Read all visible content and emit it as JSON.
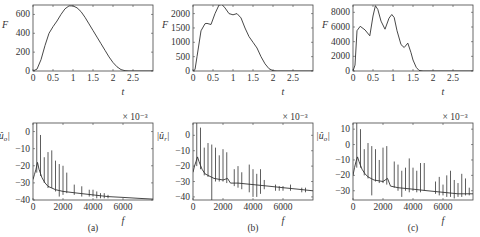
{
  "chart_data": [
    {
      "panel": "(a)",
      "row": "top",
      "type": "line",
      "xlabel": "t",
      "ylabel": "F",
      "xlim": [
        0,
        3
      ],
      "ylim": [
        0,
        700
      ],
      "xticks": [
        0,
        0.5,
        1,
        1.5,
        2,
        2.5
      ],
      "xtick_labels": [
        "0",
        "0.5",
        "1",
        "1.5",
        "2",
        "2.5"
      ],
      "yticks": [
        0,
        200,
        400,
        600
      ],
      "ytick_labels": [
        "0",
        "200",
        "400",
        "600"
      ],
      "frame": {
        "x": 33,
        "y": 5,
        "w": 120,
        "h": 66
      },
      "x": [
        0,
        0.1,
        0.2,
        0.3,
        0.4,
        0.5,
        0.6,
        0.7,
        0.8,
        0.9,
        1.0,
        1.1,
        1.2,
        1.3,
        1.4,
        1.5,
        1.6,
        1.7,
        1.8,
        1.9,
        2.0,
        2.1,
        2.2,
        2.3,
        2.4,
        2.6,
        3.0
      ],
      "values": [
        0,
        20,
        120,
        270,
        400,
        470,
        530,
        600,
        660,
        690,
        690,
        670,
        630,
        570,
        500,
        430,
        360,
        290,
        220,
        150,
        90,
        45,
        15,
        3,
        0,
        0,
        0
      ]
    },
    {
      "panel": "(b)",
      "row": "top",
      "type": "line",
      "xlabel": "t",
      "ylabel": "F",
      "xlim": [
        0,
        3
      ],
      "ylim": [
        0,
        2300
      ],
      "xticks": [
        0,
        0.5,
        1,
        1.5,
        2,
        2.5
      ],
      "xtick_labels": [
        "0",
        "0.5",
        "1",
        "1.5",
        "2",
        "2.5"
      ],
      "yticks": [
        0,
        500,
        1000,
        1500,
        2000
      ],
      "ytick_labels": [
        "0",
        "500",
        "1000",
        "1500",
        "2000"
      ],
      "frame": {
        "x": 193,
        "y": 5,
        "w": 120,
        "h": 66
      },
      "x": [
        0,
        0.05,
        0.1,
        0.2,
        0.3,
        0.35,
        0.45,
        0.55,
        0.65,
        0.72,
        0.8,
        0.9,
        1.0,
        1.1,
        1.2,
        1.3,
        1.4,
        1.5,
        1.6,
        1.7,
        1.8,
        1.9,
        2.0,
        2.1,
        3.0
      ],
      "values": [
        0,
        50,
        500,
        1400,
        1650,
        1660,
        1620,
        2000,
        2300,
        2320,
        2200,
        2000,
        1960,
        2000,
        1850,
        1500,
        1200,
        1000,
        800,
        500,
        250,
        80,
        10,
        0,
        0
      ]
    },
    {
      "panel": "(c)",
      "row": "top",
      "type": "line",
      "xlabel": "t",
      "ylabel": "F",
      "xlim": [
        0,
        3
      ],
      "ylim": [
        0,
        9000
      ],
      "xticks": [
        0,
        0.5,
        1,
        1.5,
        2,
        2.5
      ],
      "xtick_labels": [
        "0",
        "0.5",
        "1",
        "1.5",
        "2",
        "2.5"
      ],
      "yticks": [
        0,
        2000,
        4000,
        6000,
        8000
      ],
      "ytick_labels": [
        "0",
        "2000",
        "4000",
        "6000",
        "8000"
      ],
      "frame": {
        "x": 353,
        "y": 5,
        "w": 120,
        "h": 66
      },
      "x": [
        0,
        0.05,
        0.1,
        0.18,
        0.3,
        0.42,
        0.5,
        0.56,
        0.62,
        0.7,
        0.8,
        0.9,
        0.97,
        1.03,
        1.1,
        1.2,
        1.28,
        1.37,
        1.45,
        1.5,
        1.58,
        1.65,
        1.75,
        3.0
      ],
      "values": [
        0,
        800,
        5500,
        6100,
        5600,
        4800,
        7500,
        8900,
        8400,
        6800,
        5700,
        7200,
        7700,
        7300,
        5500,
        3600,
        3200,
        3800,
        2500,
        1500,
        500,
        80,
        0,
        0
      ]
    },
    {
      "panel": "(a)",
      "row": "bottom",
      "type": "line",
      "xlabel": "f",
      "ylabel": "|û_o|",
      "yscale_label": "× 10⁻³",
      "xlim": [
        0,
        8000
      ],
      "ylim": [
        -40,
        5
      ],
      "xticks": [
        0,
        2000,
        4000,
        6000
      ],
      "xtick_labels": [
        "0",
        "2000",
        "4000",
        "6000"
      ],
      "yticks": [
        0,
        -10,
        -20,
        -30,
        -40
      ],
      "ytick_labels": [
        "0",
        "−10",
        "−20",
        "−30",
        "−40"
      ],
      "frame": {
        "x": 33,
        "y": 123,
        "w": 120,
        "h": 77
      },
      "baseline": {
        "x": [
          0,
          100,
          200,
          300,
          400,
          600,
          800,
          1000,
          1500,
          2000,
          3000,
          4000,
          5000,
          6000,
          7000,
          8000
        ],
        "y": [
          -28,
          -25,
          -22,
          -18,
          -22,
          -27,
          -30,
          -32,
          -34,
          -35,
          -36,
          -37,
          -38,
          -38.5,
          -39,
          -39.5
        ]
      },
      "peaks": [
        {
          "f": 250,
          "top": 5,
          "bottom": -24
        },
        {
          "f": 500,
          "top": -2,
          "bottom": -26
        },
        {
          "f": 750,
          "top": -15,
          "bottom": -30
        },
        {
          "f": 1000,
          "top": -12,
          "bottom": -33
        },
        {
          "f": 1250,
          "top": -11,
          "bottom": -33
        },
        {
          "f": 1500,
          "top": -17,
          "bottom": -35
        },
        {
          "f": 1750,
          "top": -19,
          "bottom": -38
        },
        {
          "f": 2000,
          "top": -20,
          "bottom": -37
        },
        {
          "f": 2250,
          "top": -24,
          "bottom": -36
        },
        {
          "f": 2750,
          "top": -31,
          "bottom": -37
        },
        {
          "f": 3250,
          "top": -32,
          "bottom": -38
        },
        {
          "f": 3750,
          "top": -34,
          "bottom": -38
        },
        {
          "f": 4000,
          "top": -34,
          "bottom": -38
        },
        {
          "f": 4250,
          "top": -35,
          "bottom": -39
        },
        {
          "f": 4500,
          "top": -36,
          "bottom": -39
        },
        {
          "f": 4750,
          "top": -36,
          "bottom": -39
        },
        {
          "f": 5000,
          "top": -37,
          "bottom": -39
        }
      ]
    },
    {
      "panel": "(b)",
      "row": "bottom",
      "type": "line",
      "xlabel": "f",
      "ylabel": "|û_r|",
      "yscale_label": "× 10⁻³",
      "xlim": [
        0,
        8000
      ],
      "ylim": [
        -42,
        8
      ],
      "xticks": [
        0,
        2000,
        4000,
        6000
      ],
      "xtick_labels": [
        "0",
        "2000",
        "4000",
        "6000"
      ],
      "yticks": [
        0,
        -10,
        -20,
        -30,
        -40
      ],
      "ytick_labels": [
        "0",
        "−10",
        "−20",
        "−30",
        "−40"
      ],
      "frame": {
        "x": 193,
        "y": 123,
        "w": 120,
        "h": 77
      },
      "baseline": {
        "x": [
          0,
          100,
          200,
          300,
          400,
          600,
          800,
          1000,
          1400,
          2000,
          2300,
          2500,
          3000,
          4000,
          5000,
          6000,
          7000,
          8000
        ],
        "y": [
          -24,
          -20,
          -17,
          -14,
          -17,
          -22,
          -25,
          -26,
          -28,
          -29,
          -28,
          -31,
          -31,
          -32,
          -33,
          -34,
          -35,
          -36
        ]
      },
      "peaks": [
        {
          "f": 250,
          "top": 8,
          "bottom": -20
        },
        {
          "f": 500,
          "top": 5,
          "bottom": -22
        },
        {
          "f": 750,
          "top": -8,
          "bottom": -26
        },
        {
          "f": 1000,
          "top": -5,
          "bottom": -27
        },
        {
          "f": 1250,
          "top": -6,
          "bottom": -42
        },
        {
          "f": 1500,
          "top": -8,
          "bottom": -30
        },
        {
          "f": 1750,
          "top": -13,
          "bottom": -30
        },
        {
          "f": 2000,
          "top": -9,
          "bottom": -30
        },
        {
          "f": 2250,
          "top": -11,
          "bottom": -31
        },
        {
          "f": 2750,
          "top": -22,
          "bottom": -33
        },
        {
          "f": 3000,
          "top": -20,
          "bottom": -34
        },
        {
          "f": 3250,
          "top": -24,
          "bottom": -35
        },
        {
          "f": 3750,
          "top": -19,
          "bottom": -37
        },
        {
          "f": 4000,
          "top": -22,
          "bottom": -40
        },
        {
          "f": 4250,
          "top": -25,
          "bottom": -40
        },
        {
          "f": 4500,
          "top": -22,
          "bottom": -38
        },
        {
          "f": 4750,
          "top": -29,
          "bottom": -35
        },
        {
          "f": 5500,
          "top": -32,
          "bottom": -36
        },
        {
          "f": 5750,
          "top": -33,
          "bottom": -36
        },
        {
          "f": 6000,
          "top": -33,
          "bottom": -36
        },
        {
          "f": 6500,
          "top": -32,
          "bottom": -36
        },
        {
          "f": 7250,
          "top": -34,
          "bottom": -37
        },
        {
          "f": 7500,
          "top": -34,
          "bottom": -37
        }
      ]
    },
    {
      "panel": "(c)",
      "row": "bottom",
      "type": "line",
      "xlabel": "f",
      "ylabel": "|û_o|",
      "yscale_label": "× 10⁻³",
      "xlim": [
        0,
        8000
      ],
      "ylim": [
        -36,
        14
      ],
      "xticks": [
        0,
        2000,
        4000,
        6000
      ],
      "xtick_labels": [
        "0",
        "2000",
        "4000",
        "6000"
      ],
      "yticks": [
        10,
        0,
        -10,
        -20,
        -30
      ],
      "ytick_labels": [
        "10",
        "0",
        "−10",
        "−20",
        "−30"
      ],
      "frame": {
        "x": 353,
        "y": 123,
        "w": 120,
        "h": 77
      },
      "baseline": {
        "x": [
          0,
          100,
          200,
          300,
          400,
          600,
          800,
          1000,
          1400,
          2000,
          2300,
          2500,
          3000,
          4000,
          5000,
          6000,
          7000,
          8000
        ],
        "y": [
          -20,
          -15,
          -11,
          -8,
          -11,
          -16,
          -19,
          -21,
          -23,
          -24,
          -22,
          -27,
          -28,
          -29,
          -30,
          -31,
          -32,
          -32
        ]
      },
      "peaks": [
        {
          "f": 250,
          "top": 14,
          "bottom": -15
        },
        {
          "f": 500,
          "top": 10,
          "bottom": -15
        },
        {
          "f": 750,
          "top": -3,
          "bottom": -20
        },
        {
          "f": 1000,
          "top": 1,
          "bottom": -22
        },
        {
          "f": 1250,
          "top": -1,
          "bottom": -33
        },
        {
          "f": 1500,
          "top": -3,
          "bottom": -24
        },
        {
          "f": 1750,
          "top": -10,
          "bottom": -25
        },
        {
          "f": 2000,
          "top": -2,
          "bottom": -25
        },
        {
          "f": 2250,
          "top": -1,
          "bottom": -26
        },
        {
          "f": 2750,
          "top": -11,
          "bottom": -28
        },
        {
          "f": 3000,
          "top": -13,
          "bottom": -30
        },
        {
          "f": 3250,
          "top": -17,
          "bottom": -34
        },
        {
          "f": 3500,
          "top": -15,
          "bottom": -30
        },
        {
          "f": 3750,
          "top": -9,
          "bottom": -31
        },
        {
          "f": 4000,
          "top": -15,
          "bottom": -30
        },
        {
          "f": 4250,
          "top": -17,
          "bottom": -31
        },
        {
          "f": 4500,
          "top": -12,
          "bottom": -31
        },
        {
          "f": 4750,
          "top": -12,
          "bottom": -30
        },
        {
          "f": 5500,
          "top": -24,
          "bottom": -32
        },
        {
          "f": 5750,
          "top": -21,
          "bottom": -33
        },
        {
          "f": 6000,
          "top": -26,
          "bottom": -33
        },
        {
          "f": 6250,
          "top": -20,
          "bottom": -34
        },
        {
          "f": 6500,
          "top": -17,
          "bottom": -34
        },
        {
          "f": 6750,
          "top": -23,
          "bottom": -35
        },
        {
          "f": 7000,
          "top": -25,
          "bottom": -34
        },
        {
          "f": 7250,
          "top": -19,
          "bottom": -34
        },
        {
          "f": 7500,
          "top": -22,
          "bottom": -33
        },
        {
          "f": 7750,
          "top": -28,
          "bottom": -33
        }
      ]
    }
  ],
  "captions": [
    "(a)",
    "(b)",
    "(c)"
  ]
}
